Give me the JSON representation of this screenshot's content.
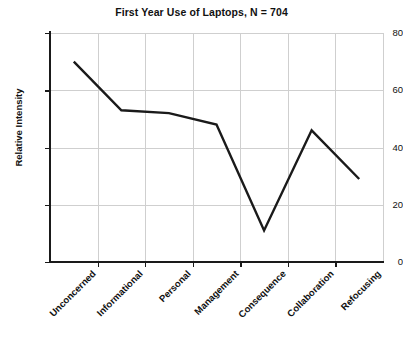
{
  "chart_data": {
    "type": "line",
    "title": "First Year Use of Laptops, N = 704",
    "xlabel": "",
    "ylabel": "Relative Intensity",
    "categories": [
      "Unconcerned",
      "Informational",
      "Personal",
      "Management",
      "Consequence",
      "Collaboration",
      "Refocusing"
    ],
    "values": [
      70,
      53,
      52,
      48,
      11,
      46,
      29
    ],
    "series": [
      {
        "name": "Relative Intensity",
        "values": [
          70,
          53,
          52,
          48,
          11,
          46,
          29
        ]
      }
    ],
    "ylim": [
      0,
      80
    ],
    "yticks": [
      0,
      20,
      40,
      60,
      80
    ],
    "ytick_labels": [
      "0",
      "20",
      "40",
      "60",
      "80"
    ],
    "grid": "both",
    "legend": "none",
    "line_color": "#1a1a1a",
    "grid_color": "#cfcfcf",
    "axis_color": "#1a1a1a",
    "background": "#ffffff",
    "markers": "none"
  }
}
